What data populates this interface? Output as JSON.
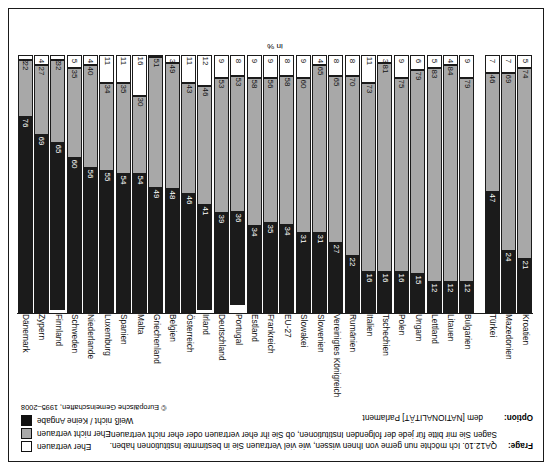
{
  "question": {
    "label": "Frage:",
    "line1": "QA12.10. Ich möchte nun gerne von Ihnen wissen, wie viel Vertrauen Sie in bestimmte Institutionen haben.",
    "line2": "Sagen Sie mir bitte für jede der folgenden Institutionen, ob Sie ihr eher vertrauen oder eher nicht vertrauen."
  },
  "option": {
    "label": "Option:",
    "value": "dem [NATIONALITÄT] Parlament"
  },
  "unit": "in %",
  "legend": {
    "items": [
      {
        "label": "Eher vertrauen",
        "swatch": "white",
        "color": "#ffffff"
      },
      {
        "label": "Eher nicht vertrauen",
        "swatch": "gray",
        "color": "#a8a8a8"
      },
      {
        "label": "Weiß nicht / Keine Angabe",
        "swatch": "black",
        "color": "#1b1b1b"
      }
    ],
    "copyright": "© Europäische Gemeinschaften, 1995–2008"
  },
  "chart_data": {
    "type": "bar",
    "stacked": true,
    "title": "",
    "xlabel": "",
    "ylabel": "in %",
    "ylim": [
      0,
      100
    ],
    "grid": false,
    "legend_position": "top-right",
    "series": [
      {
        "name": "Eher vertrauen",
        "color": "#ffffff",
        "values": [
          5,
          7,
          7,
          null,
          6,
          4,
          5,
          9,
          6,
          3,
          11,
          8,
          8,
          4,
          9,
          8,
          9,
          9,
          8,
          9,
          12,
          11,
          3,
          0,
          16,
          11,
          11,
          4,
          5,
          2,
          4,
          2
        ]
      },
      {
        "name": "Eher nicht vertrauen",
        "color": "#a8a8a8",
        "values": [
          74,
          69,
          46,
          null,
          79,
          84,
          83,
          79,
          75,
          81,
          73,
          70,
          65,
          65,
          60,
          58,
          56,
          58,
          53,
          53,
          46,
          43,
          49,
          51,
          30,
          35,
          34,
          40,
          35,
          32,
          27,
          22
        ]
      },
      {
        "name": "Weiß nicht / Keine Angabe",
        "color": "#1b1b1b",
        "values": [
          21,
          24,
          47,
          null,
          15,
          12,
          12,
          12,
          16,
          16,
          16,
          22,
          27,
          31,
          31,
          34,
          35,
          33,
          39,
          38,
          42,
          46,
          48,
          49,
          54,
          54,
          55,
          56,
          60,
          66,
          69,
          76
        ]
      }
    ],
    "categories": [
      "Kroatien",
      "Mazedonien",
      "Türkei",
      "",
      "Bulgarien",
      "Litauen",
      "Lettland",
      "Ungarn",
      "Polen",
      "Tschechien",
      "Italien",
      "Rumänien",
      "Vereinigtes Königreich",
      "Slowenien",
      "Slowakei",
      "EU-27",
      "Frankreich",
      "Estland",
      "Portugal",
      "Deutschland",
      "Irland",
      "Österreich",
      "Belgien",
      "Griechenland",
      "Malta",
      "Spanien",
      "Luxemburg",
      "Niederlande",
      "Schweden",
      "Finnland",
      "Zypern",
      "Dänemark"
    ],
    "bars": [
      {
        "country": "Kroatien",
        "gap": false,
        "black": 21,
        "gray": 74,
        "white": 5
      },
      {
        "country": "Mazedonien",
        "gap": false,
        "black": 24,
        "gray": 69,
        "white": 7
      },
      {
        "country": "Türkei",
        "gap": false,
        "black": 47,
        "gray": 46,
        "white": 7
      },
      {
        "country": "",
        "gap": true,
        "black": 0,
        "gray": 0,
        "white": 0
      },
      {
        "country": "Bulgarien",
        "gap": false,
        "black": 12,
        "gray": 79,
        "white": 9
      },
      {
        "country": "Litauen",
        "gap": false,
        "black": 12,
        "gray": 84,
        "white": 4
      },
      {
        "country": "Lettland",
        "gap": false,
        "black": 12,
        "gray": 83,
        "white": 5
      },
      {
        "country": "Ungarn",
        "gap": false,
        "black": 15,
        "gray": 79,
        "white": 6
      },
      {
        "country": "Polen",
        "gap": false,
        "black": 16,
        "gray": 75,
        "white": 9
      },
      {
        "country": "Tschechien",
        "gap": false,
        "black": 16,
        "gray": 81,
        "white": 3
      },
      {
        "country": "Italien",
        "gap": false,
        "black": 16,
        "gray": 73,
        "white": 11
      },
      {
        "country": "Rumänien",
        "gap": false,
        "black": 22,
        "gray": 70,
        "white": 8
      },
      {
        "country": "Vereinigtes Königreich",
        "gap": false,
        "black": 27,
        "gray": 65,
        "white": 8
      },
      {
        "country": "Slowenien",
        "gap": false,
        "black": 31,
        "gray": 65,
        "white": 4
      },
      {
        "country": "Slowakei",
        "gap": false,
        "black": 31,
        "gray": 60,
        "white": 9
      },
      {
        "country": "EU-27",
        "gap": false,
        "black": 34,
        "gray": 58,
        "white": 8
      },
      {
        "country": "Frankreich",
        "gap": false,
        "black": 35,
        "gray": 56,
        "white": 9
      },
      {
        "country": "Estland",
        "gap": false,
        "black": 34,
        "gray": 58,
        "white": 9
      },
      {
        "country": "Portugal",
        "gap": false,
        "black": 36,
        "gray": 53,
        "white": 8
      },
      {
        "country": "Deutschland",
        "gap": false,
        "black": 39,
        "gray": 53,
        "white": 9
      },
      {
        "country": "Irland",
        "gap": false,
        "black": 41,
        "gray": 46,
        "white": 12
      },
      {
        "country": "Österreich",
        "gap": false,
        "black": 46,
        "gray": 43,
        "white": 11
      },
      {
        "country": "Belgien",
        "gap": false,
        "black": 48,
        "gray": 49,
        "white": 3
      },
      {
        "country": "Griechenland",
        "gap": false,
        "black": 49,
        "gray": 51,
        "white": 0
      },
      {
        "country": "Malta",
        "gap": false,
        "black": 54,
        "gray": 30,
        "white": 16
      },
      {
        "country": "Spanien",
        "gap": false,
        "black": 54,
        "gray": 35,
        "white": 11
      },
      {
        "country": "Luxemburg",
        "gap": false,
        "black": 55,
        "gray": 34,
        "white": 11
      },
      {
        "country": "Niederlande",
        "gap": false,
        "black": 56,
        "gray": 40,
        "white": 4
      },
      {
        "country": "Schweden",
        "gap": false,
        "black": 60,
        "gray": 35,
        "white": 5
      },
      {
        "country": "Finnland",
        "gap": false,
        "black": 65,
        "gray": 32,
        "white": 2
      },
      {
        "country": "Zypern",
        "gap": false,
        "black": 69,
        "gray": 27,
        "white": 4
      },
      {
        "country": "Dänemark",
        "gap": false,
        "black": 76,
        "gray": 22,
        "white": 2
      }
    ]
  }
}
